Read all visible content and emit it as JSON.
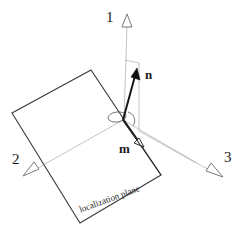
{
  "figure": {
    "kind": "3d-vector-diagram",
    "background_color": "#ffffff",
    "stroke_dark": "#1a1a1a",
    "stroke_light": "#b0b0b0",
    "axes": [
      {
        "name": "axis-1",
        "label": "1",
        "direction": "up"
      },
      {
        "name": "axis-2",
        "label": "2",
        "direction": "lower-left"
      },
      {
        "name": "axis-3",
        "label": "3",
        "direction": "lower-right"
      }
    ],
    "vectors": [
      {
        "name": "normal-vector",
        "label": "n"
      },
      {
        "name": "in-plane-vector",
        "label": "m"
      }
    ],
    "plane": {
      "label": "localization plane"
    }
  }
}
